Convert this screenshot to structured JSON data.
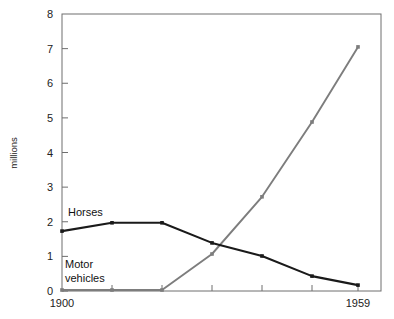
{
  "chart_data": {
    "type": "line",
    "title": "",
    "subtitle": "",
    "xlabel": "",
    "ylabel": "millions",
    "xlim": [
      1900,
      1959
    ],
    "ylim": [
      0,
      8
    ],
    "grid": false,
    "legend_position": "inline-annotation",
    "x_tick_labels": [
      "1900",
      "1959"
    ],
    "x_tick_values": [
      1900,
      1910,
      1920,
      1930,
      1940,
      1950,
      1959
    ],
    "y_tick_labels": [
      "0",
      "1",
      "2",
      "3",
      "4",
      "5",
      "6",
      "7",
      "8"
    ],
    "y_tick_values": [
      0,
      1,
      2,
      3,
      4,
      5,
      6,
      7,
      8
    ],
    "x": [
      1900,
      1910,
      1920,
      1930,
      1940,
      1950,
      1959
    ],
    "series": [
      {
        "name": "Horses",
        "color": "#1a1a1a",
        "label_text": "Horses",
        "values": [
          1.73,
          1.97,
          1.97,
          1.39,
          1.01,
          0.43,
          0.17
        ]
      },
      {
        "name": "Motor vehicles",
        "color": "#7d7d7d",
        "label_text_line1": "Motor",
        "label_text_line2": "vehicles",
        "values": [
          0.03,
          0.03,
          0.03,
          1.07,
          2.72,
          4.88,
          7.05
        ]
      }
    ],
    "annotations": [
      {
        "text": "Horses",
        "x": 1908,
        "y": 2.42
      },
      {
        "text": "Motor",
        "x": 1907,
        "y": 0.95
      },
      {
        "text": "vehicles",
        "x": 1907,
        "y": 0.58
      }
    ]
  },
  "axis": {
    "y_label": "millions",
    "y_ticks": [
      "8",
      "7",
      "6",
      "5",
      "4",
      "3",
      "2",
      "1",
      "0"
    ],
    "x_first": "1900",
    "x_last": "1959"
  },
  "labels": {
    "horses": "Horses",
    "motor_line1": "Motor",
    "motor_line2": "vehicles"
  }
}
